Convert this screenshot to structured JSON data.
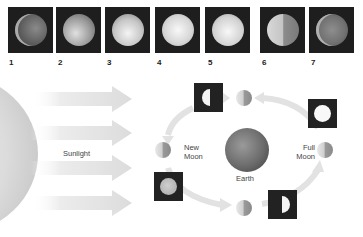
{
  "top_row": {
    "photos": [
      {
        "label": "1",
        "phase": "waning crescent / new"
      },
      {
        "label": "2",
        "phase": "waxing gibbous"
      },
      {
        "label": "3",
        "phase": "gibbous"
      },
      {
        "label": "4",
        "phase": "full"
      },
      {
        "label": "5",
        "phase": "full"
      },
      {
        "label": "6",
        "phase": "half (quarter)"
      },
      {
        "label": "7",
        "phase": "crescent"
      }
    ]
  },
  "diagram": {
    "sunlight_label": "Sunlight",
    "earth_label": "Earth",
    "new_moon_label_line1": "New",
    "new_moon_label_line2": "Moon",
    "full_moon_label_line1": "Full",
    "full_moon_label_line2": "Moon"
  },
  "colors": {
    "background": "#ffffff",
    "photo_bg": "#1e1e1e",
    "arrow": "#e4e4e4",
    "text": "#444444"
  }
}
